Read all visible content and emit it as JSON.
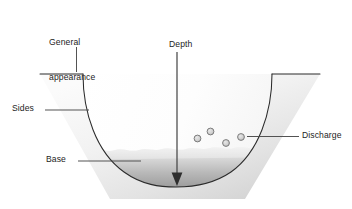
{
  "diagram": {
    "background_color": "#ffffff",
    "outline_color": "#262626",
    "bank_fill_light": "#f4f4f4",
    "bank_fill_dark": "#c9c9c9",
    "water_fill_light": "#e2e2e2",
    "water_fill_dark": "#8d8d8d",
    "bubble_fill": "#c8c8c8",
    "bubble_stroke": "#6e6e6e",
    "leader_color": "#3a3a3a",
    "labels": {
      "general_appearance": "General\nappearance",
      "general_appearance_line1": "General",
      "general_appearance_line2": "appearance",
      "depth": "Depth",
      "sides": "Sides",
      "base": "Base",
      "discharge": "Discharge"
    },
    "callouts": [
      {
        "name": "general-appearance",
        "label": "General appearance",
        "leader": "vertical"
      },
      {
        "name": "depth",
        "label": "Depth",
        "leader": "vertical-arrow"
      },
      {
        "name": "sides",
        "label": "Sides",
        "leader": "horizontal"
      },
      {
        "name": "base",
        "label": "Base",
        "leader": "horizontal"
      },
      {
        "name": "discharge",
        "label": "Discharge",
        "leader": "horizontal"
      }
    ],
    "bubbles": [
      {
        "cx": 197.5,
        "cy": 138.5,
        "r": 3.6
      },
      {
        "cx": 210.5,
        "cy": 131.5,
        "r": 3.6
      },
      {
        "cx": 226.0,
        "cy": 143.0,
        "r": 3.6
      },
      {
        "cx": 241.0,
        "cy": 137.0,
        "r": 3.6
      }
    ]
  }
}
